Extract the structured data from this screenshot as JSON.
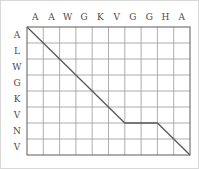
{
  "chart_data": {
    "type": "line",
    "title": "",
    "xlabel": "",
    "ylabel": "",
    "grid": true,
    "legend": "none",
    "columns": [
      "A",
      "A",
      "W",
      "G",
      "K",
      "V",
      "G",
      "G",
      "H",
      "A"
    ],
    "rows": [
      "A",
      "L",
      "W",
      "G",
      "K",
      "V",
      "N",
      "V"
    ],
    "n_columns": 10,
    "n_rows": 8,
    "xlim": [
      0,
      10
    ],
    "ylim": [
      0,
      8
    ],
    "series": [
      {
        "name": "traceback-path",
        "points": [
          {
            "x": 0,
            "y": 0
          },
          {
            "x": 6,
            "y": 6
          },
          {
            "x": 8,
            "y": 6
          },
          {
            "x": 10,
            "y": 8
          }
        ]
      }
    ],
    "segments": [
      {
        "kind": "diagonal",
        "from": [
          0,
          0
        ],
        "to": [
          6,
          6
        ]
      },
      {
        "kind": "horizontal",
        "from": [
          6,
          6
        ],
        "to": [
          8,
          6
        ]
      },
      {
        "kind": "diagonal",
        "from": [
          8,
          6
        ],
        "to": [
          10,
          8
        ]
      }
    ]
  },
  "colors": {
    "path": "#5a5a5a",
    "gridline": "#9a9a9a",
    "border": "#6a6a6a",
    "label": "#4a4a4a",
    "background": "#ffffff",
    "outer_frame": "#d8d8d8"
  },
  "geometry": {
    "plot_left": 27,
    "plot_top": 27,
    "plot_right": 190,
    "plot_bottom": 155,
    "cell_width": 16.3,
    "cell_height": 16
  }
}
